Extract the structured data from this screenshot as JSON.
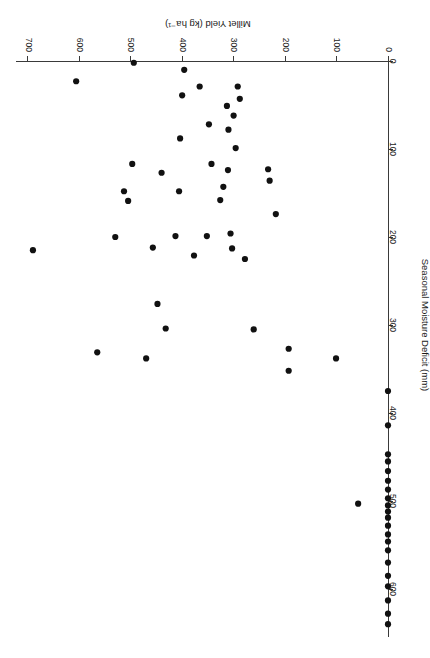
{
  "chart_data": {
    "type": "scatter",
    "title": "",
    "xlabel": "Millet Yield (kg ha-1)",
    "xlabel_display": "Millet Yield (kg ha⁻¹)",
    "ylabel": "Seasonal Moisture Deficit (mm)",
    "xlim": [
      0,
      730
    ],
    "ylim": [
      0,
      660
    ],
    "xticks": [
      0,
      100,
      200,
      300,
      400,
      500,
      600,
      700
    ],
    "yticks": [
      0,
      100,
      200,
      300,
      400,
      500,
      600
    ],
    "xtick_labels": [
      "0",
      "100",
      "200",
      "300",
      "400",
      "500",
      "600",
      "700"
    ],
    "ytick_labels": [
      "0",
      "100",
      "200",
      "300",
      "400",
      "500",
      "600"
    ],
    "grid": false,
    "legend": false,
    "marker": "filled-circle",
    "marker_color": "#111111",
    "marker_size": 5,
    "rotation_deg": 180,
    "points": [
      {
        "x": 0,
        "y": 640
      },
      {
        "x": 0,
        "y": 628
      },
      {
        "x": 0,
        "y": 613
      },
      {
        "x": 0,
        "y": 597
      },
      {
        "x": 0,
        "y": 585
      },
      {
        "x": 0,
        "y": 570
      },
      {
        "x": 0,
        "y": 556
      },
      {
        "x": 0,
        "y": 546
      },
      {
        "x": 0,
        "y": 538
      },
      {
        "x": 0,
        "y": 528
      },
      {
        "x": 0,
        "y": 519
      },
      {
        "x": 0,
        "y": 512
      },
      {
        "x": 0,
        "y": 505
      },
      {
        "x": 0,
        "y": 497
      },
      {
        "x": 0,
        "y": 487
      },
      {
        "x": 0,
        "y": 477
      },
      {
        "x": 0,
        "y": 466
      },
      {
        "x": 0,
        "y": 455
      },
      {
        "x": 0,
        "y": 447
      },
      {
        "x": 0,
        "y": 414
      },
      {
        "x": 0,
        "y": 375
      },
      {
        "x": 58,
        "y": 503
      },
      {
        "x": 101,
        "y": 338
      },
      {
        "x": 193,
        "y": 352
      },
      {
        "x": 193,
        "y": 327
      },
      {
        "x": 218,
        "y": 174
      },
      {
        "x": 230,
        "y": 136
      },
      {
        "x": 233,
        "y": 123
      },
      {
        "x": 261,
        "y": 305
      },
      {
        "x": 278,
        "y": 225
      },
      {
        "x": 288,
        "y": 43
      },
      {
        "x": 292,
        "y": 29
      },
      {
        "x": 296,
        "y": 99
      },
      {
        "x": 300,
        "y": 62
      },
      {
        "x": 303,
        "y": 213
      },
      {
        "x": 306,
        "y": 196
      },
      {
        "x": 310,
        "y": 78
      },
      {
        "x": 311,
        "y": 124
      },
      {
        "x": 313,
        "y": 51
      },
      {
        "x": 320,
        "y": 143
      },
      {
        "x": 326,
        "y": 158
      },
      {
        "x": 343,
        "y": 117
      },
      {
        "x": 348,
        "y": 72
      },
      {
        "x": 352,
        "y": 199
      },
      {
        "x": 366,
        "y": 29
      },
      {
        "x": 377,
        "y": 221
      },
      {
        "x": 396,
        "y": 10
      },
      {
        "x": 400,
        "y": 39
      },
      {
        "x": 404,
        "y": 88
      },
      {
        "x": 406,
        "y": 148
      },
      {
        "x": 413,
        "y": 199
      },
      {
        "x": 432,
        "y": 304
      },
      {
        "x": 440,
        "y": 127
      },
      {
        "x": 448,
        "y": 276
      },
      {
        "x": 457,
        "y": 212
      },
      {
        "x": 470,
        "y": 338
      },
      {
        "x": 494,
        "y": 2
      },
      {
        "x": 497,
        "y": 117
      },
      {
        "x": 505,
        "y": 159
      },
      {
        "x": 513,
        "y": 148
      },
      {
        "x": 530,
        "y": 200
      },
      {
        "x": 565,
        "y": 331
      },
      {
        "x": 606,
        "y": 23
      },
      {
        "x": 690,
        "y": 215
      }
    ]
  },
  "axes": {
    "x_axis_name": "millet-yield-axis",
    "y_axis_name": "seasonal-moisture-deficit-axis"
  }
}
